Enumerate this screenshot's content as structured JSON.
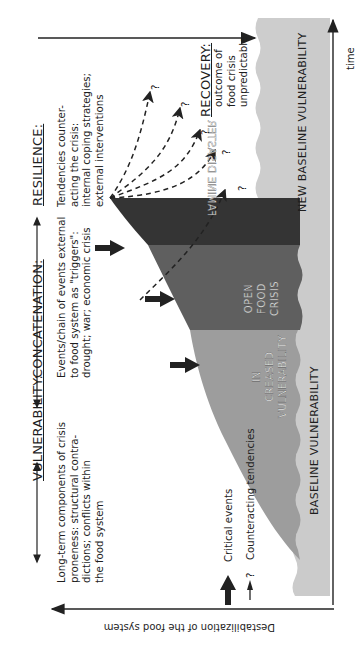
{
  "diagram": {
    "orientation": "rotated-90-clockwise",
    "axes": {
      "x_label": "time",
      "y_label": "Destabilization of the food system"
    },
    "phases": [
      {
        "id": "vulnerability",
        "heading": "VULNERABILITY:",
        "description_lines": [
          "Long-term components of crisis",
          "proneness:  structural contra-",
          "dictions; conflicts within",
          "the food system"
        ]
      },
      {
        "id": "concatenation",
        "heading": "CONCATENATION:",
        "description_lines": [
          "Events/chain of events external",
          "to food system as \"triggers\":",
          "drought; war; economic crisis"
        ]
      },
      {
        "id": "resilience",
        "heading": "RESILIENCE:",
        "description_lines": [
          "Tendencies counter-",
          "acting the crisis:",
          "internal coping strategies;",
          "external interventions"
        ]
      },
      {
        "id": "recovery",
        "heading": "RECOVERY:",
        "description_lines": [
          "outcome of",
          "food crisis",
          "unpredictable"
        ]
      }
    ],
    "zones": {
      "baseline": "BASELINE VULNERABILITY",
      "new_baseline": "NEW BASELINE VULNERABILITY",
      "increased": [
        "IN",
        "CREASED",
        "VULNERABILITY"
      ],
      "open_crisis": [
        "OPEN",
        "FOOD",
        "CRISIS"
      ],
      "famine": "FAMINE DISASTER"
    },
    "legend": {
      "critical_events": "Critical events",
      "counteracting_tendencies": "Counteracting tendencies",
      "question_mark": "?"
    },
    "outcome_marker": "?",
    "colors": {
      "baseline": "#c8c8c8",
      "increased": "#9a9a9a",
      "open_crisis": "#5e5e5e",
      "famine": "#333333",
      "line": "#222222"
    }
  }
}
